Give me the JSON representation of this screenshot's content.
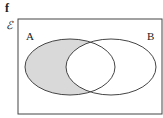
{
  "figure": {
    "label": "f",
    "universal_set_symbol": "ℰ",
    "sets": [
      {
        "name": "A",
        "label": "A"
      },
      {
        "name": "B",
        "label": "B"
      }
    ],
    "shaded_region": "A only (A ∩ B')",
    "colors": {
      "shade": "#d9d9d9",
      "stroke": "#444444",
      "background": "#ffffff"
    }
  }
}
